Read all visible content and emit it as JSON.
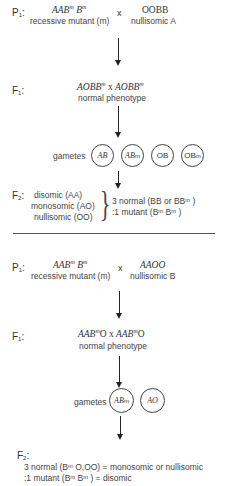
{
  "cross_1": {
    "p1": {
      "label": "P",
      "label_sub": "1",
      "colon": ":",
      "parent_left": {
        "genotype_parts": [
          "AAB",
          "m",
          " B",
          "m"
        ],
        "description": "recessive mutant (m)"
      },
      "cross_symbol": "x",
      "parent_right": {
        "genotype": "OOBB",
        "description": "nullisomic A"
      }
    },
    "f1": {
      "label": "F",
      "label_sub": "1",
      "colon": ":",
      "genotype_left_parts": [
        "AOBB",
        "m"
      ],
      "cross_symbol": "x",
      "genotype_right_parts": [
        "AOBB",
        "m"
      ],
      "description": "normal phenotype"
    },
    "gametes": {
      "label": "gametes",
      "items": [
        {
          "text": "AB",
          "sup": ""
        },
        {
          "text": "AB",
          "sup": "m"
        },
        {
          "text": "OB",
          "sup": ""
        },
        {
          "text": "OB",
          "sup": "m"
        }
      ]
    },
    "f2": {
      "label": "F",
      "label_sub": "2",
      "colon": ":",
      "classes": [
        "disomic (AA)",
        "monosomic (AO)",
        "nullisomic (OO)"
      ],
      "ratio_lines": [
        "3 normal (BB or BBᵐ )",
        ":1 mutant (Bᵐ Bᵐ )"
      ]
    }
  },
  "cross_2": {
    "p1": {
      "label": "P",
      "label_sub": "1",
      "colon": ":",
      "parent_left": {
        "genotype_parts": [
          "AAB",
          "m",
          " B",
          "m"
        ],
        "description": "recessive mutant (m)"
      },
      "cross_symbol": "x",
      "parent_right": {
        "genotype": "AAOO",
        "description": "nullisomic B"
      }
    },
    "f1": {
      "label": "F",
      "label_sub": "1",
      "colon": ":",
      "genotype_left_parts": [
        "AAB",
        "m",
        "O"
      ],
      "cross_symbol": "x",
      "genotype_right_parts": [
        "AAB",
        "m",
        "O"
      ],
      "description": "normal phenotype"
    },
    "gametes": {
      "label": "gametes",
      "items": [
        {
          "text": "AB",
          "sup": "m"
        },
        {
          "text": "AO",
          "sup": ""
        }
      ]
    },
    "f2": {
      "label": "F",
      "label_sub": "2",
      "colon": ":",
      "lines": [
        "3 normal (Bᵐ O,OO) = monosomic or nullisomic",
        ":1 mutant (Bᵐ Bᵐ ) = disomic"
      ]
    }
  }
}
